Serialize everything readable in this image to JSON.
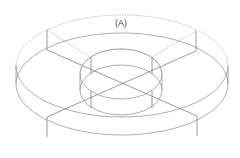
{
  "diagram": {
    "title": "",
    "label": "(A)",
    "colors": {
      "line": "#8a8a8a",
      "background": "#ffffff"
    }
  }
}
